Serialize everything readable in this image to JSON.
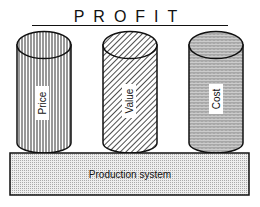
{
  "title": "PROFIT",
  "pillars": [
    {
      "label": "Price",
      "pattern": "vertical-lines"
    },
    {
      "label": "Value",
      "pattern": "diagonal-lines"
    },
    {
      "label": "Cost",
      "pattern": "wavy-texture"
    }
  ],
  "base": {
    "label": "Production system",
    "pattern": "dotted"
  },
  "colors": {
    "stroke": "#111111",
    "background": "#ffffff"
  }
}
